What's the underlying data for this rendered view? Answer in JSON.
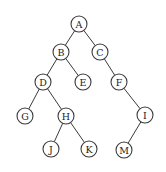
{
  "diagram": {
    "type": "binary-tree",
    "node_radius": 8,
    "colors": {
      "stroke": "#3a3a3a",
      "fill": "#ffffff",
      "text": "#222222",
      "background": "#ffffff"
    },
    "nodes": [
      {
        "id": "A",
        "label": "A",
        "x": 79,
        "y": 24
      },
      {
        "id": "B",
        "label": "B",
        "x": 61,
        "y": 52
      },
      {
        "id": "C",
        "label": "C",
        "x": 100,
        "y": 52
      },
      {
        "id": "D",
        "label": "D",
        "x": 43,
        "y": 82
      },
      {
        "id": "E",
        "label": "E",
        "x": 83,
        "y": 82
      },
      {
        "id": "F",
        "label": "F",
        "x": 119,
        "y": 82
      },
      {
        "id": "G",
        "label": "G",
        "x": 25,
        "y": 116
      },
      {
        "id": "H",
        "label": "H",
        "x": 66,
        "y": 116
      },
      {
        "id": "I",
        "label": "I",
        "x": 145,
        "y": 115
      },
      {
        "id": "J",
        "label": "J",
        "x": 51,
        "y": 149
      },
      {
        "id": "K",
        "label": "K",
        "x": 89,
        "y": 149
      },
      {
        "id": "M",
        "label": "M",
        "x": 124,
        "y": 150
      }
    ],
    "edges": [
      [
        "A",
        "B"
      ],
      [
        "A",
        "C"
      ],
      [
        "B",
        "D"
      ],
      [
        "B",
        "E"
      ],
      [
        "C",
        "F"
      ],
      [
        "D",
        "G"
      ],
      [
        "D",
        "H"
      ],
      [
        "F",
        "I"
      ],
      [
        "H",
        "J"
      ],
      [
        "H",
        "K"
      ],
      [
        "I",
        "M"
      ]
    ]
  }
}
